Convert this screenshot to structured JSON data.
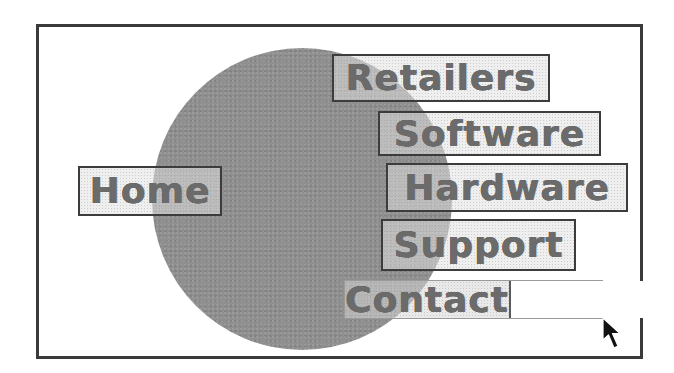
{
  "diagram": {
    "type": "menu-layout-sketch",
    "background_shape": {
      "shape": "circle",
      "fill": "#8f8f8f"
    },
    "frame": {
      "border_color": "#3a3a3a"
    },
    "menu": {
      "items": [
        {
          "id": "retailers",
          "label": "Retailers"
        },
        {
          "id": "software",
          "label": "Software"
        },
        {
          "id": "hardware",
          "label": "Hardware"
        },
        {
          "id": "home",
          "label": "Home"
        },
        {
          "id": "support",
          "label": "Support"
        },
        {
          "id": "contact",
          "label": "Contact",
          "state": "hovered"
        }
      ]
    },
    "contact_field": {
      "value": ""
    },
    "pointer": {
      "icon": "arrow-cursor-icon"
    }
  }
}
